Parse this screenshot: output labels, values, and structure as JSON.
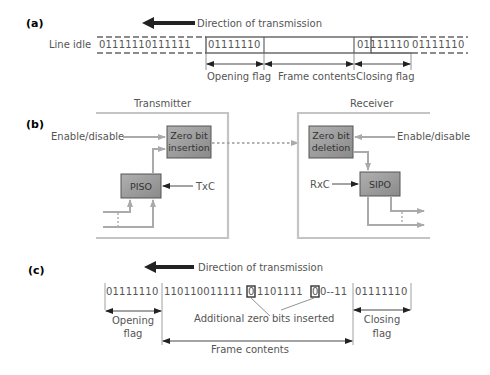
{
  "colors": {
    "text": "#555555",
    "frame_line": "#666666",
    "block_border": "#bdbdbd",
    "block_fill": "#9a9a9a",
    "block_fill_light": "#bdbdbd",
    "arrow_dark": "#222222"
  },
  "part_a": {
    "label": "(a)",
    "direction": "Direction of transmission",
    "line_idle": "Line idle",
    "idle_bits_left": "01111110111111",
    "opening_flag_bits": "01111110",
    "closing_flag_bits": "01111110",
    "idle_bits_right": "01111110",
    "opening_flag": "Opening flag",
    "frame_contents": "Frame contents",
    "closing_flag": "Closing flag"
  },
  "part_b": {
    "label": "(b)",
    "transmitter": {
      "title": "Transmitter",
      "enable": "Enable/disable",
      "zero_insert_line1": "Zero bit",
      "zero_insert_line2": "insertion",
      "piso": "PISO",
      "clock": "TxC"
    },
    "receiver": {
      "title": "Receiver",
      "enable": "Enable/disable",
      "zero_delete_line1": "Zero bit",
      "zero_delete_line2": "deletion",
      "sipo": "SIPO",
      "clock": "RxC"
    }
  },
  "part_c": {
    "label": "(c)",
    "direction": "Direction of transmission",
    "opening_flag_bits": "01111110",
    "data_bits_1": "110110011111",
    "inserted_bit_1": "0",
    "data_bits_2": "1101111",
    "inserted_bit_2": "0",
    "data_bits_3": "0--11",
    "closing_flag_bits": "01111110",
    "additional": "Additional zero bits inserted",
    "opening_flag_line1": "Opening",
    "opening_flag_line2": "flag",
    "frame_contents": "Frame contents",
    "closing_flag_line1": "Closing",
    "closing_flag_line2": "flag"
  }
}
